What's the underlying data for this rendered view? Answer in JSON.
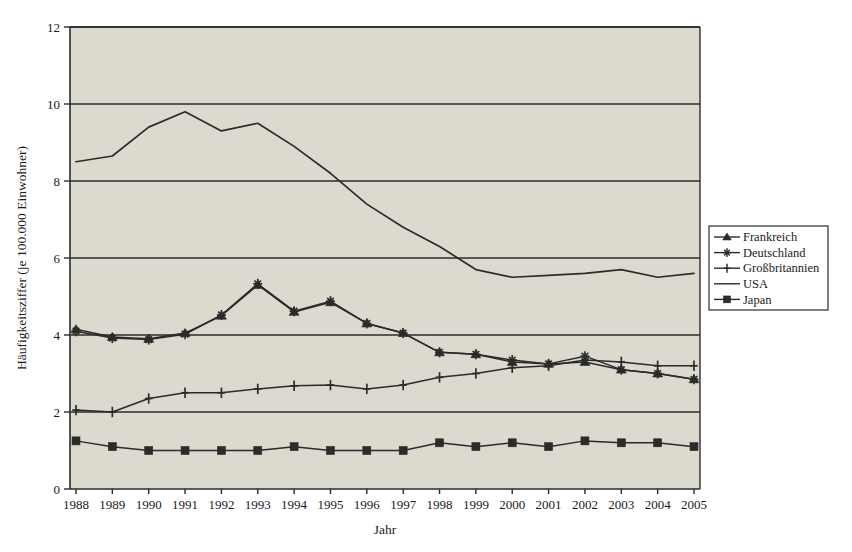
{
  "chart_data": {
    "type": "line",
    "title": "",
    "xlabel": "Jahr",
    "ylabel": "Häufigkeitsziffer (je 100.000 Einwohner)",
    "xlim": [
      1988,
      2005
    ],
    "ylim": [
      0,
      12
    ],
    "ytick_labels": [
      "0",
      "2",
      "4",
      "6",
      "8",
      "10",
      "12"
    ],
    "yticks": [
      0,
      2,
      4,
      6,
      8,
      10,
      12
    ],
    "grid": "horizontal",
    "legend_position": "right-outside",
    "plot_background": "#dcd9cf",
    "line_color": "#2b2b2b",
    "categories": [
      1988,
      1989,
      1990,
      1991,
      1992,
      1993,
      1994,
      1995,
      1996,
      1997,
      1998,
      1999,
      2000,
      2001,
      2002,
      2003,
      2004,
      2005
    ],
    "xtick_labels": [
      "1988",
      "1989",
      "1990",
      "1991",
      "1992",
      "1993",
      "1994",
      "1995",
      "1996",
      "1997",
      "1998",
      "1999",
      "2000",
      "2001",
      "2002",
      "2003",
      "2004",
      "2005"
    ],
    "series": [
      {
        "name": "Frankreich",
        "marker": "triangle",
        "values": [
          4.15,
          3.95,
          3.9,
          4.05,
          4.5,
          5.3,
          4.6,
          4.85,
          4.3,
          4.05,
          3.55,
          3.5,
          3.3,
          3.25,
          3.3,
          3.1,
          3.0,
          2.85
        ]
      },
      {
        "name": "Deutschland",
        "marker": "star",
        "values": [
          4.1,
          3.92,
          3.88,
          4.02,
          4.52,
          5.33,
          4.62,
          4.88,
          4.3,
          4.05,
          3.55,
          3.5,
          3.35,
          3.25,
          3.45,
          3.1,
          3.0,
          2.85
        ]
      },
      {
        "name": "Großbritannien",
        "marker": "plus",
        "values": [
          2.05,
          2.0,
          2.35,
          2.5,
          2.5,
          2.6,
          2.68,
          2.7,
          2.6,
          2.7,
          2.9,
          3.0,
          3.15,
          3.2,
          3.35,
          3.3,
          3.2,
          3.2
        ]
      },
      {
        "name": "USA",
        "marker": "none",
        "values": [
          8.5,
          8.65,
          9.4,
          9.8,
          9.3,
          9.5,
          8.9,
          8.2,
          7.4,
          6.8,
          6.3,
          5.7,
          5.5,
          5.55,
          5.6,
          5.7,
          5.5,
          5.6
        ]
      },
      {
        "name": "Japan",
        "marker": "square",
        "values": [
          1.25,
          1.1,
          1.0,
          1.0,
          1.0,
          1.0,
          1.1,
          1.0,
          1.0,
          1.0,
          1.2,
          1.1,
          1.2,
          1.1,
          1.25,
          1.2,
          1.2,
          1.1
        ]
      }
    ]
  },
  "legend": {
    "items": [
      {
        "label": "Frankreich",
        "marker": "triangle"
      },
      {
        "label": "Deutschland",
        "marker": "star"
      },
      {
        "label": "Großbritannien",
        "marker": "plus"
      },
      {
        "label": "USA",
        "marker": "none"
      },
      {
        "label": "Japan",
        "marker": "square"
      }
    ]
  }
}
